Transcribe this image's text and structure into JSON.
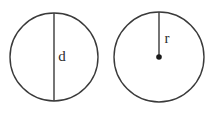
{
  "document": {
    "title": "Circle diameter and radius diagram",
    "background_color": "#ffffff",
    "width": 216,
    "height": 114
  },
  "style": {
    "stroke_color": "#3a3a3a",
    "stroke_width": 1.4,
    "label_color": "#2b2b2b",
    "dot_color": "#1a1a1a",
    "label_font_size": 15
  },
  "figures": [
    {
      "name": "diameter-circle",
      "circle": {
        "cx": 54,
        "cy": 57,
        "r": 44
      },
      "segment": {
        "name": "diameter-line",
        "x1": 54,
        "y1": 13,
        "x2": 54,
        "y2": 101
      },
      "label": {
        "text": "d",
        "x": 62,
        "y": 58
      },
      "center_dot": null
    },
    {
      "name": "radius-circle",
      "circle": {
        "cx": 159,
        "cy": 57,
        "r": 45
      },
      "segment": {
        "name": "radius-line",
        "x1": 159,
        "y1": 12,
        "x2": 159,
        "y2": 57
      },
      "label": {
        "text": "r",
        "x": 167,
        "y": 40
      },
      "center_dot": {
        "cx": 159,
        "cy": 57,
        "r": 2.8
      }
    }
  ]
}
